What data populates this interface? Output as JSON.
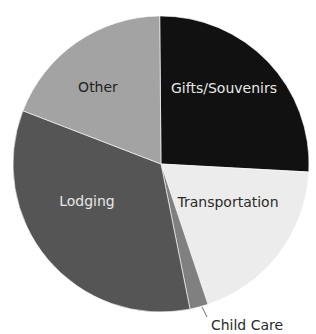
{
  "chart_data": {
    "type": "pie",
    "title": "",
    "start_angle_deg": -0.5,
    "direction": "clockwise",
    "slices": [
      {
        "label": "Gifts/Souvenirs",
        "value": 26,
        "color": "#111111",
        "text_color": "#e8e8e8",
        "label_pos": [
          224,
          93
        ]
      },
      {
        "label": "Transportation",
        "value": 19,
        "color": "#ececec",
        "text_color": "#2a2a2a",
        "label_pos": [
          228,
          207
        ]
      },
      {
        "label": "Child Care",
        "value": 2,
        "color": "#808080",
        "text_color": "#2a2a2a",
        "label_pos": [
          247,
          330
        ],
        "external": true,
        "leader": [
          [
            202,
            307
          ],
          [
            207,
            317
          ]
        ]
      },
      {
        "label": "Lodging",
        "value": 34,
        "color": "#555555",
        "text_color": "#e8e8e8",
        "label_pos": [
          87,
          206
        ]
      },
      {
        "label": "Other",
        "value": 19,
        "color": "#a3a3a3",
        "text_color": "#222222",
        "label_pos": [
          98,
          92
        ]
      }
    ],
    "center": [
      161,
      164
    ],
    "radius": 148,
    "legend": "none"
  }
}
